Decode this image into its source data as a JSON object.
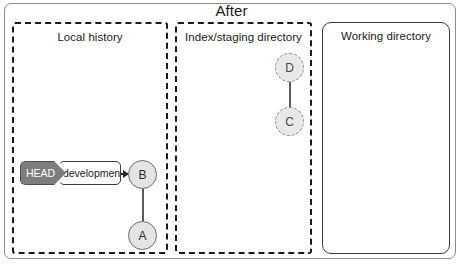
{
  "figure": {
    "title": "After"
  },
  "panels": [
    {
      "id": "local-history",
      "title": "Local history",
      "style": "dashed"
    },
    {
      "id": "index-staging",
      "title": "Index/staging directory",
      "style": "dashed"
    },
    {
      "id": "working-directory",
      "title": "Working directory",
      "style": "solid"
    }
  ],
  "nodes": {
    "a": {
      "label": "A",
      "state": "committed",
      "panel": "local-history"
    },
    "b": {
      "label": "B",
      "state": "committed",
      "panel": "local-history"
    },
    "c": {
      "label": "C",
      "state": "staged",
      "panel": "index-staging"
    },
    "d": {
      "label": "D",
      "state": "staged",
      "panel": "index-staging"
    }
  },
  "pointers": {
    "head": "HEAD",
    "branch": "development"
  },
  "colors": {
    "node_fill": "#e4e4e4",
    "node_border_solid": "#6c6c6c",
    "node_border_dashed": "#8f8f8f",
    "head_badge_bg": "#7d7d7d",
    "head_badge_text": "#ffffff",
    "panel_border": "#1a1a1a",
    "frame_border": "#8d8d8d",
    "edge": "#5a5a5a"
  }
}
